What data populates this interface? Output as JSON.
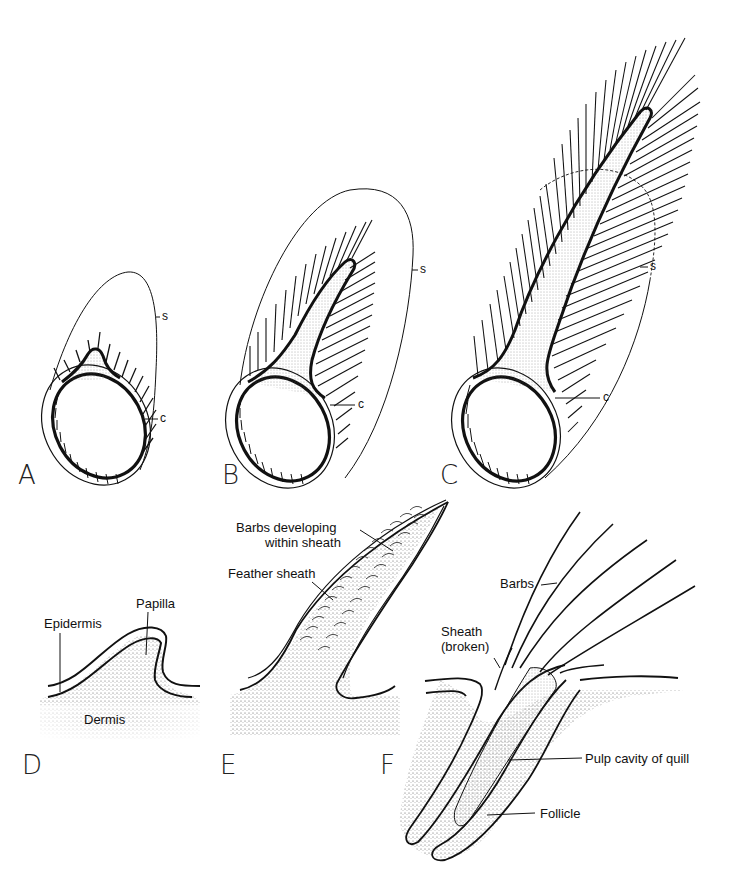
{
  "figure": {
    "panels": [
      {
        "id": "A",
        "label": "A",
        "annotations": {
          "s": "s",
          "c": "c"
        },
        "barb_count": 15
      },
      {
        "id": "B",
        "label": "B",
        "annotations": {
          "s": "s",
          "c": "c"
        },
        "barb_count": 25
      },
      {
        "id": "C",
        "label": "C",
        "annotations": {
          "s": "s",
          "c": "c"
        },
        "barb_count": 37
      },
      {
        "id": "D",
        "label": "D",
        "annotations": {
          "epidermis": "Epidermis",
          "papilla": "Papilla",
          "dermis": "Dermis"
        }
      },
      {
        "id": "E",
        "label": "E",
        "annotations": {
          "barbs_developing_line1": "Barbs developing",
          "barbs_developing_line2": "within sheath",
          "feather_sheath": "Feather sheath"
        }
      },
      {
        "id": "F",
        "label": "F",
        "annotations": {
          "barbs": "Barbs",
          "sheath_line1": "Sheath",
          "sheath_line2": "(broken)",
          "pulp_cavity": "Pulp cavity of quill",
          "follicle": "Follicle"
        }
      }
    ],
    "colors": {
      "ink": "#111111",
      "stipple": "#555555",
      "background": "#ffffff"
    }
  }
}
